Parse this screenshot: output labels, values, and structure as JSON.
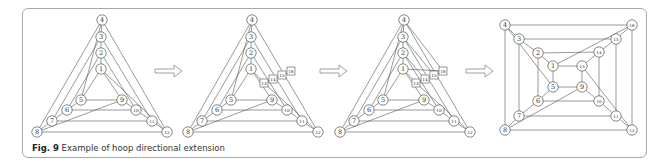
{
  "caption": {
    "label": "Fig. 9",
    "text": " Example of hoop directional extension"
  },
  "colors": {
    "line": "#555555",
    "node_fill": "#ffffff",
    "node_stroke": "#555555",
    "arrow": "#888888",
    "frame": "#a8a8a8"
  },
  "arrows": [
    {
      "x": 155,
      "y": 71,
      "w": 27
    },
    {
      "x": 320,
      "y": 71,
      "w": 27
    },
    {
      "x": 466,
      "y": 71,
      "w": 27
    }
  ],
  "diagrams": [
    {
      "name": "triangle-base",
      "nodes": [
        {
          "id": "4",
          "x": 102,
          "y": 20
        },
        {
          "id": "3",
          "x": 101,
          "y": 37
        },
        {
          "id": "2",
          "x": 101,
          "y": 53
        },
        {
          "id": "1",
          "x": 101,
          "y": 69
        },
        {
          "id": "5",
          "x": 81,
          "y": 100
        },
        {
          "id": "9",
          "x": 122,
          "y": 100
        },
        {
          "id": "6",
          "x": 67,
          "y": 110
        },
        {
          "id": "10",
          "x": 136,
          "y": 110
        },
        {
          "id": "7",
          "x": 52,
          "y": 121
        },
        {
          "id": "11",
          "x": 152,
          "y": 121
        },
        {
          "id": "8",
          "x": 37,
          "y": 132
        },
        {
          "id": "12",
          "x": 167,
          "y": 132
        }
      ],
      "edges": [
        [
          "4",
          "8"
        ],
        [
          "4",
          "12"
        ],
        [
          "3",
          "7"
        ],
        [
          "3",
          "11"
        ],
        [
          "2",
          "6"
        ],
        [
          "2",
          "10"
        ],
        [
          "1",
          "5"
        ],
        [
          "1",
          "9"
        ],
        [
          "5",
          "9"
        ],
        [
          "6",
          "10"
        ],
        [
          "7",
          "11"
        ],
        [
          "8",
          "12"
        ],
        [
          "4",
          "3"
        ],
        [
          "3",
          "2"
        ],
        [
          "2",
          "1"
        ],
        [
          "5",
          "6"
        ],
        [
          "6",
          "7"
        ],
        [
          "7",
          "8"
        ],
        [
          "9",
          "10"
        ],
        [
          "10",
          "11"
        ],
        [
          "11",
          "12"
        ],
        [
          "4",
          "5"
        ],
        [
          "1",
          "12"
        ],
        [
          "8",
          "9"
        ]
      ]
    },
    {
      "name": "triangle-extended",
      "nodes": [
        {
          "id": "4",
          "x": 252,
          "y": 20
        },
        {
          "id": "3",
          "x": 251,
          "y": 37
        },
        {
          "id": "2",
          "x": 251,
          "y": 53
        },
        {
          "id": "1",
          "x": 251,
          "y": 69
        },
        {
          "id": "5",
          "x": 231,
          "y": 100
        },
        {
          "id": "9",
          "x": 272,
          "y": 100
        },
        {
          "id": "6",
          "x": 217,
          "y": 110
        },
        {
          "id": "10",
          "x": 287,
          "y": 110
        },
        {
          "id": "7",
          "x": 202,
          "y": 121
        },
        {
          "id": "11",
          "x": 302,
          "y": 121
        },
        {
          "id": "8",
          "x": 188,
          "y": 132
        },
        {
          "id": "12",
          "x": 318,
          "y": 132
        },
        {
          "id": "13",
          "x": 264,
          "y": 83,
          "sq": true
        },
        {
          "id": "14",
          "x": 273,
          "y": 79,
          "sq": true
        },
        {
          "id": "15",
          "x": 282,
          "y": 75,
          "sq": true
        },
        {
          "id": "16",
          "x": 291,
          "y": 71,
          "sq": true
        }
      ],
      "edges": [
        [
          "4",
          "8"
        ],
        [
          "4",
          "12"
        ],
        [
          "3",
          "7"
        ],
        [
          "3",
          "11"
        ],
        [
          "2",
          "6"
        ],
        [
          "2",
          "10"
        ],
        [
          "1",
          "5"
        ],
        [
          "1",
          "9"
        ],
        [
          "5",
          "9"
        ],
        [
          "6",
          "10"
        ],
        [
          "7",
          "11"
        ],
        [
          "8",
          "12"
        ],
        [
          "4",
          "3"
        ],
        [
          "3",
          "2"
        ],
        [
          "2",
          "1"
        ],
        [
          "5",
          "6"
        ],
        [
          "6",
          "7"
        ],
        [
          "7",
          "8"
        ],
        [
          "9",
          "10"
        ],
        [
          "10",
          "11"
        ],
        [
          "11",
          "12"
        ],
        [
          "4",
          "5"
        ],
        [
          "8",
          "9"
        ],
        [
          "1",
          "13"
        ],
        [
          "13",
          "12"
        ],
        [
          "13",
          "14"
        ],
        [
          "14",
          "15"
        ],
        [
          "15",
          "16"
        ]
      ]
    },
    {
      "name": "triangle-connected",
      "nodes": [
        {
          "id": "4",
          "x": 404,
          "y": 20
        },
        {
          "id": "3",
          "x": 403,
          "y": 37
        },
        {
          "id": "2",
          "x": 403,
          "y": 53
        },
        {
          "id": "1",
          "x": 403,
          "y": 69
        },
        {
          "id": "5",
          "x": 383,
          "y": 100
        },
        {
          "id": "9",
          "x": 424,
          "y": 100
        },
        {
          "id": "6",
          "x": 369,
          "y": 110
        },
        {
          "id": "10",
          "x": 439,
          "y": 110
        },
        {
          "id": "7",
          "x": 354,
          "y": 121
        },
        {
          "id": "11",
          "x": 454,
          "y": 121
        },
        {
          "id": "8",
          "x": 340,
          "y": 132
        },
        {
          "id": "12",
          "x": 470,
          "y": 132
        },
        {
          "id": "13",
          "x": 416,
          "y": 83,
          "sq": true
        },
        {
          "id": "14",
          "x": 425,
          "y": 79,
          "sq": true
        },
        {
          "id": "15",
          "x": 434,
          "y": 75,
          "sq": true
        },
        {
          "id": "16",
          "x": 443,
          "y": 71,
          "sq": true
        }
      ],
      "edges": [
        [
          "4",
          "8"
        ],
        [
          "4",
          "12"
        ],
        [
          "3",
          "7"
        ],
        [
          "3",
          "11"
        ],
        [
          "2",
          "6"
        ],
        [
          "2",
          "10"
        ],
        [
          "1",
          "5"
        ],
        [
          "1",
          "9"
        ],
        [
          "5",
          "9"
        ],
        [
          "6",
          "10"
        ],
        [
          "7",
          "11"
        ],
        [
          "8",
          "12"
        ],
        [
          "4",
          "3"
        ],
        [
          "3",
          "2"
        ],
        [
          "2",
          "1"
        ],
        [
          "5",
          "6"
        ],
        [
          "6",
          "7"
        ],
        [
          "7",
          "8"
        ],
        [
          "9",
          "10"
        ],
        [
          "10",
          "11"
        ],
        [
          "11",
          "12"
        ],
        [
          "4",
          "5"
        ],
        [
          "8",
          "9"
        ],
        [
          "1",
          "13"
        ],
        [
          "13",
          "12"
        ],
        [
          "13",
          "14"
        ],
        [
          "14",
          "15"
        ],
        [
          "15",
          "16"
        ],
        [
          "1",
          "16"
        ],
        [
          "4",
          "16"
        ],
        [
          "3",
          "15"
        ],
        [
          "2",
          "14"
        ]
      ]
    },
    {
      "name": "square-extended",
      "nodes": [
        {
          "id": "4",
          "x": 505,
          "y": 25
        },
        {
          "id": "3",
          "x": 519,
          "y": 39
        },
        {
          "id": "2",
          "x": 538,
          "y": 53
        },
        {
          "id": "1",
          "x": 553,
          "y": 66
        },
        {
          "id": "13",
          "x": 582,
          "y": 66
        },
        {
          "id": "14",
          "x": 599,
          "y": 52
        },
        {
          "id": "15",
          "x": 616,
          "y": 39
        },
        {
          "id": "16",
          "x": 632,
          "y": 25
        },
        {
          "id": "5",
          "x": 553,
          "y": 87
        },
        {
          "id": "9",
          "x": 582,
          "y": 87
        },
        {
          "id": "6",
          "x": 538,
          "y": 101
        },
        {
          "id": "10",
          "x": 599,
          "y": 101
        },
        {
          "id": "7",
          "x": 519,
          "y": 116
        },
        {
          "id": "11",
          "x": 616,
          "y": 116
        },
        {
          "id": "8",
          "x": 505,
          "y": 130
        },
        {
          "id": "12",
          "x": 632,
          "y": 130
        }
      ],
      "edges": [
        [
          "4",
          "16"
        ],
        [
          "16",
          "12"
        ],
        [
          "12",
          "8"
        ],
        [
          "8",
          "4"
        ],
        [
          "3",
          "15"
        ],
        [
          "15",
          "11"
        ],
        [
          "11",
          "7"
        ],
        [
          "7",
          "3"
        ],
        [
          "2",
          "14"
        ],
        [
          "14",
          "10"
        ],
        [
          "10",
          "6"
        ],
        [
          "6",
          "2"
        ],
        [
          "1",
          "13"
        ],
        [
          "13",
          "9"
        ],
        [
          "9",
          "5"
        ],
        [
          "5",
          "1"
        ],
        [
          "4",
          "3"
        ],
        [
          "3",
          "2"
        ],
        [
          "2",
          "1"
        ],
        [
          "16",
          "15"
        ],
        [
          "15",
          "14"
        ],
        [
          "14",
          "13"
        ],
        [
          "12",
          "11"
        ],
        [
          "11",
          "10"
        ],
        [
          "10",
          "9"
        ],
        [
          "8",
          "7"
        ],
        [
          "7",
          "6"
        ],
        [
          "6",
          "5"
        ],
        [
          "4",
          "5"
        ],
        [
          "1",
          "16"
        ],
        [
          "8",
          "9"
        ],
        [
          "13",
          "12"
        ]
      ]
    }
  ]
}
